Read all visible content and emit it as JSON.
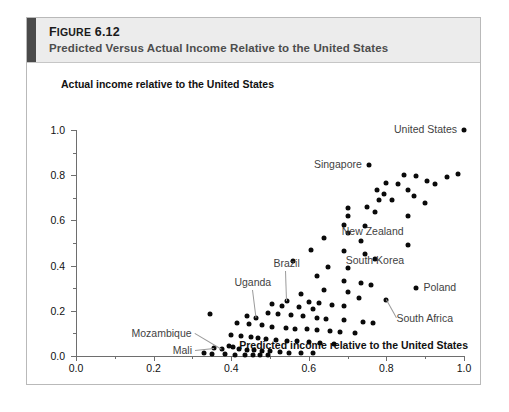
{
  "figure": {
    "number_prefix": "F",
    "number_caps": "IGURE",
    "number": "6.12",
    "number_full": "Figure 6.12",
    "subtitle": "Predicted Versus Actual Income Relative to the United States"
  },
  "chart_data": {
    "type": "scatter",
    "title": "Predicted Versus Actual Income Relative to the United States",
    "xlabel": "Predicted income relative to the United States",
    "ylabel": "Actual income relative to the United States",
    "xlim": [
      0.0,
      1.0
    ],
    "ylim": [
      0.0,
      1.0
    ],
    "xticks": [
      "0.0",
      "0.2",
      "0.4",
      "0.6",
      "0.8",
      "1.0"
    ],
    "xtick_values": [
      0.0,
      0.2,
      0.4,
      0.6,
      0.8,
      1.0
    ],
    "yticks": [
      "0.0",
      "0.2",
      "0.4",
      "0.6",
      "0.8",
      "1.0"
    ],
    "ytick_values": [
      0.0,
      0.2,
      0.4,
      0.6,
      0.8,
      1.0
    ],
    "minor_ticks": true,
    "grid": false,
    "legend": "none",
    "marker": "filled-circle",
    "marker_color": "#0a0a0a",
    "points": [
      [
        1.0,
        1.0
      ],
      [
        0.755,
        0.845
      ],
      [
        0.845,
        0.8
      ],
      [
        0.875,
        0.795
      ],
      [
        0.985,
        0.805
      ],
      [
        0.955,
        0.79
      ],
      [
        0.8,
        0.765
      ],
      [
        0.83,
        0.76
      ],
      [
        0.905,
        0.775
      ],
      [
        0.925,
        0.76
      ],
      [
        0.775,
        0.735
      ],
      [
        0.855,
        0.735
      ],
      [
        0.795,
        0.715
      ],
      [
        0.87,
        0.71
      ],
      [
        0.78,
        0.69
      ],
      [
        0.815,
        0.69
      ],
      [
        0.9,
        0.675
      ],
      [
        0.75,
        0.66
      ],
      [
        0.7,
        0.655
      ],
      [
        0.77,
        0.635
      ],
      [
        0.7,
        0.62
      ],
      [
        0.855,
        0.62
      ],
      [
        0.69,
        0.58
      ],
      [
        0.745,
        0.575
      ],
      [
        0.7,
        0.545
      ],
      [
        0.64,
        0.52
      ],
      [
        0.735,
        0.51
      ],
      [
        0.855,
        0.49
      ],
      [
        0.605,
        0.47
      ],
      [
        0.69,
        0.465
      ],
      [
        0.745,
        0.45
      ],
      [
        0.77,
        0.43
      ],
      [
        0.56,
        0.42
      ],
      [
        0.65,
        0.395
      ],
      [
        0.7,
        0.39
      ],
      [
        0.62,
        0.355
      ],
      [
        0.69,
        0.33
      ],
      [
        0.735,
        0.325
      ],
      [
        0.76,
        0.315
      ],
      [
        0.875,
        0.3
      ],
      [
        0.64,
        0.29
      ],
      [
        0.7,
        0.285
      ],
      [
        0.58,
        0.275
      ],
      [
        0.73,
        0.255
      ],
      [
        0.8,
        0.25
      ],
      [
        0.545,
        0.245
      ],
      [
        0.6,
        0.24
      ],
      [
        0.625,
        0.235
      ],
      [
        0.66,
        0.225
      ],
      [
        0.69,
        0.22
      ],
      [
        0.505,
        0.23
      ],
      [
        0.53,
        0.22
      ],
      [
        0.575,
        0.215
      ],
      [
        0.61,
        0.21
      ],
      [
        0.345,
        0.185
      ],
      [
        0.44,
        0.175
      ],
      [
        0.465,
        0.17
      ],
      [
        0.495,
        0.19
      ],
      [
        0.52,
        0.185
      ],
      [
        0.555,
        0.18
      ],
      [
        0.585,
        0.175
      ],
      [
        0.62,
        0.17
      ],
      [
        0.645,
        0.165
      ],
      [
        0.69,
        0.16
      ],
      [
        0.74,
        0.15
      ],
      [
        0.765,
        0.145
      ],
      [
        0.415,
        0.145
      ],
      [
        0.445,
        0.14
      ],
      [
        0.48,
        0.135
      ],
      [
        0.505,
        0.13
      ],
      [
        0.54,
        0.125
      ],
      [
        0.565,
        0.12
      ],
      [
        0.595,
        0.118
      ],
      [
        0.62,
        0.115
      ],
      [
        0.655,
        0.11
      ],
      [
        0.68,
        0.105
      ],
      [
        0.72,
        0.1
      ],
      [
        0.4,
        0.095
      ],
      [
        0.425,
        0.09
      ],
      [
        0.45,
        0.085
      ],
      [
        0.47,
        0.08
      ],
      [
        0.49,
        0.075
      ],
      [
        0.515,
        0.072
      ],
      [
        0.545,
        0.068
      ],
      [
        0.57,
        0.065
      ],
      [
        0.6,
        0.06
      ],
      [
        0.63,
        0.058
      ],
      [
        0.665,
        0.055
      ],
      [
        0.355,
        0.035
      ],
      [
        0.375,
        0.032
      ],
      [
        0.395,
        0.045
      ],
      [
        0.405,
        0.04
      ],
      [
        0.42,
        0.03
      ],
      [
        0.44,
        0.028
      ],
      [
        0.46,
        0.025
      ],
      [
        0.48,
        0.022
      ],
      [
        0.5,
        0.02
      ],
      [
        0.525,
        0.018
      ],
      [
        0.55,
        0.015
      ],
      [
        0.58,
        0.014
      ],
      [
        0.61,
        0.012
      ],
      [
        0.33,
        0.012
      ],
      [
        0.35,
        0.01
      ],
      [
        0.385,
        0.008
      ],
      [
        0.41,
        0.006
      ],
      [
        0.435,
        0.005
      ],
      [
        0.455,
        0.004
      ],
      [
        0.475,
        0.004
      ],
      [
        0.495,
        0.003
      ]
    ],
    "annotations": [
      {
        "label": "United States",
        "x": 1.0,
        "y": 1.0,
        "side": "left",
        "leader": false
      },
      {
        "label": "Singapore",
        "x": 0.755,
        "y": 0.845,
        "side": "left",
        "leader": false
      },
      {
        "label": "New Zealand",
        "x": 0.855,
        "y": 0.62,
        "side": "below-left",
        "leader": false
      },
      {
        "label": "South Korea",
        "x": 0.855,
        "y": 0.49,
        "side": "below-left",
        "leader": false
      },
      {
        "label": "Poland",
        "x": 0.875,
        "y": 0.3,
        "side": "right-dot",
        "leader": false
      },
      {
        "label": "South Africa",
        "x": 0.8,
        "y": 0.25,
        "side": "leader",
        "leader": true
      },
      {
        "label": "Brazil",
        "x": 0.545,
        "y": 0.245,
        "side": "leader",
        "leader": true
      },
      {
        "label": "Uganda",
        "x": 0.465,
        "y": 0.17,
        "side": "leader",
        "leader": true
      },
      {
        "label": "Mozambique",
        "x": 0.375,
        "y": 0.032,
        "side": "leader",
        "leader": true
      },
      {
        "label": "Mali",
        "x": 0.355,
        "y": 0.035,
        "side": "leader",
        "leader": true
      }
    ]
  }
}
